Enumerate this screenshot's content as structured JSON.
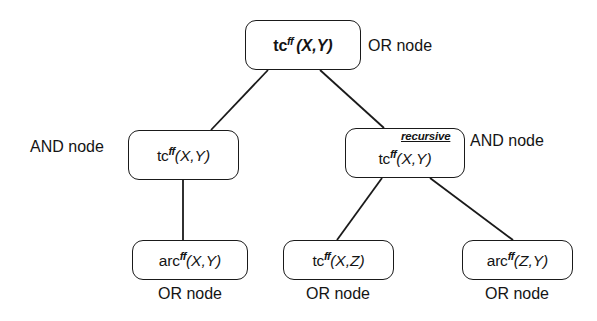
{
  "diagram": {
    "background_color": "#ffffff",
    "stroke_color": "#1a1a1a",
    "nodes": [
      {
        "id": "root",
        "predicate": "tc",
        "superscript": "ff",
        "args": "(X,Y)",
        "kind": "OR node",
        "bold": true,
        "x": 245,
        "y": 20,
        "w": 116,
        "h": 50
      },
      {
        "id": "and-left",
        "predicate": "tc",
        "superscript": "ff",
        "args": "(X,Y)",
        "kind": "AND node",
        "bold": false,
        "x": 128,
        "y": 130,
        "w": 111,
        "h": 50
      },
      {
        "id": "and-right",
        "predicate": "tc",
        "superscript": "ff",
        "args": "(X,Y)",
        "kind": "AND node",
        "bold": false,
        "tag": "recursive",
        "x": 345,
        "y": 128,
        "w": 120,
        "h": 50
      },
      {
        "id": "leaf-arc-xy",
        "predicate": "arc",
        "superscript": "ff",
        "args": "(X,Y)",
        "kind": "OR node",
        "bold": false,
        "x": 132,
        "y": 240,
        "w": 116,
        "h": 40
      },
      {
        "id": "leaf-tc-xz",
        "predicate": "tc",
        "superscript": "ff",
        "args": "(X,Z)",
        "kind": "OR node",
        "bold": false,
        "x": 283,
        "y": 240,
        "w": 111,
        "h": 40
      },
      {
        "id": "leaf-arc-zy",
        "predicate": "arc",
        "superscript": "ff",
        "args": "(Z,Y)",
        "kind": "OR node",
        "bold": false,
        "x": 462,
        "y": 240,
        "w": 111,
        "h": 40
      }
    ],
    "labels": {
      "root_kind": "OR node",
      "and_left_kind": "AND node",
      "and_right_kind": "AND node",
      "leaf_left_kind": "OR node",
      "leaf_mid_kind": "OR node",
      "leaf_right_kind": "OR node",
      "recursive_tag": "recursive"
    },
    "edges": [
      {
        "from": "root",
        "to": "and-left",
        "x1": 268,
        "y1": 70,
        "x2": 211,
        "y2": 130
      },
      {
        "from": "root",
        "to": "and-right",
        "x1": 320,
        "y1": 70,
        "x2": 384,
        "y2": 128
      },
      {
        "from": "and-left",
        "to": "leaf-arc-xy",
        "x1": 183,
        "y1": 180,
        "x2": 183,
        "y2": 240
      },
      {
        "from": "and-right",
        "to": "leaf-tc-xz",
        "x1": 382,
        "y1": 178,
        "x2": 337,
        "y2": 240
      },
      {
        "from": "and-right",
        "to": "leaf-arc-zy",
        "x1": 430,
        "y1": 178,
        "x2": 513,
        "y2": 240
      }
    ]
  }
}
